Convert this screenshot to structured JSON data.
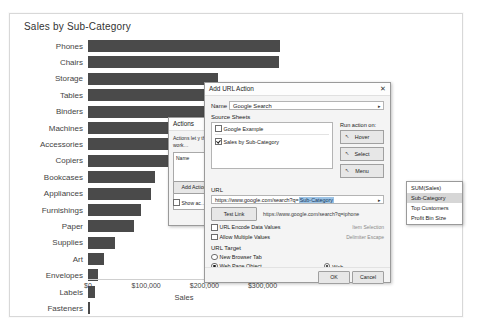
{
  "viz": {
    "title": "Sales by Sub-Category"
  },
  "chart_data": {
    "type": "bar",
    "title": "Sales by Sub-Category",
    "xlabel": "Sales",
    "ylabel": "",
    "orientation": "horizontal",
    "xlim": [
      0,
      330000
    ],
    "grid": false,
    "legend": "none",
    "ticks": [
      "$0",
      "$100,000",
      "$200,000",
      "$300,000"
    ],
    "tick_values": [
      0,
      100000,
      200000,
      300000
    ],
    "categories": [
      "Phones",
      "Chairs",
      "Storage",
      "Tables",
      "Binders",
      "Machines",
      "Accessories",
      "Copiers",
      "Bookcases",
      "Appliances",
      "Furnishings",
      "Paper",
      "Supplies",
      "Art",
      "Envelopes",
      "Labels",
      "Fasteners"
    ],
    "values": [
      330007,
      328449,
      223844,
      206966,
      203413,
      189239,
      167380,
      149528,
      114880,
      107532,
      91705,
      78479,
      46674,
      27119,
      16476,
      12486,
      3024
    ]
  },
  "actions_dialog": {
    "title": "Actions",
    "description": "Actions let y\nthis work…",
    "list_header": "Name",
    "add_action_label": "Add Action",
    "show_actions_label": "Show ac…"
  },
  "url_dialog": {
    "title": "Add URL Action",
    "close_label": "✕",
    "name_label": "Name",
    "name_value": "Google Search",
    "name_dropdown_glyph": "▸",
    "source_sheets_label": "Source Sheets",
    "sheets": [
      {
        "label": "Google Example",
        "checked": false
      },
      {
        "label": "Sales by Sub-Category",
        "checked": true
      }
    ],
    "run_action_on_label": "Run action on:",
    "run_action_buttons": [
      "Hover",
      "Select",
      "Menu"
    ],
    "url_section_label": "URL",
    "url_prefix": "https://www.google.com/search?q=",
    "url_field_highlight": "Sub-Category",
    "url_field_arrow": "▸",
    "test_link_label": "Test Link",
    "test_link_preview": "https://www.google.com/search?q=iphone",
    "option_url_encode": "URL Encode Data Values",
    "option_url_encode_hint": "Item Selection",
    "option_allow_multiple": "Allow Multiple Values",
    "option_allow_multiple_hint": "Delimiter Escape",
    "url_target_label": "URL Target",
    "targets": [
      {
        "label": "New Browser Tab",
        "selected": false
      },
      {
        "label": "Web Page Object",
        "selected": true
      },
      {
        "label": "Browser Tab if No Web Page Object Exists",
        "selected": false
      }
    ],
    "web_page_object_value": "Web",
    "ok_label": "OK",
    "cancel_label": "Cancel"
  },
  "dropdown": {
    "items": [
      {
        "label": "SUM(Sales)",
        "selected": false
      },
      {
        "label": "Sub-Category",
        "selected": true
      },
      {
        "label": "Top Customers",
        "selected": false
      },
      {
        "label": "Profit Bin Size",
        "selected": false
      }
    ]
  }
}
